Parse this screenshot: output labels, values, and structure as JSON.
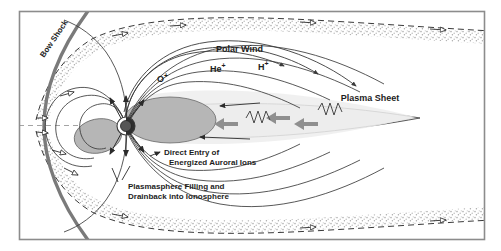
{
  "figure": {
    "title_present": false,
    "background_color": "#ffffff",
    "frame_color": "#8c8c8c",
    "ink_color": "#2b2b2b",
    "accent_gray": "#9b9b9b",
    "plasma_fill": "#e2e2e2",
    "lobe_fill": "#b3b3b3",
    "sheath_stipple": "#bdbdbd"
  },
  "labels": {
    "bow_shock": "Bow Shock",
    "polar_wind": "Polar Wind",
    "oxygen_ion": "O",
    "oxygen_sup": "+",
    "helium_ion": "He",
    "helium_sup": "+",
    "hydrogen_ion": "H",
    "hydrogen_sup": "+",
    "plasma_sheet": "Plasma Sheet",
    "direct_entry_line1": "Direct Entry of",
    "direct_entry_line2": "Energized Auroral Ions",
    "plasmasphere_line1": "Plasmasphere Filling and",
    "plasmasphere_line2": "Drainback into Ionosphere"
  },
  "features": {
    "earth": "earth-body",
    "magnetopause": "dashed-boundary",
    "magnetosheath": "stippled-band",
    "wave_symbol": "zigzag-wave",
    "bulk_flow_arrows": "thick-gray-arrows",
    "field_lines": "magnetic-field-lines",
    "solar_wind_arrows": "open-triangle-arrows"
  }
}
